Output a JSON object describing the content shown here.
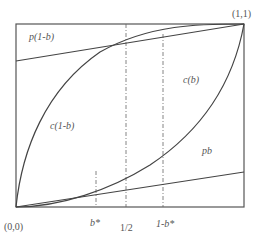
{
  "diagram": {
    "corners": {
      "origin": "(0,0)",
      "top_right": "(1,1)"
    },
    "curve_labels": {
      "p_one_minus_b": "p(1-b)",
      "c_b": "c(b)",
      "c_one_minus_b": "c(1-b)",
      "pb": "pb"
    },
    "x_ticks": {
      "b_star": "b*",
      "half": "1/2",
      "one_minus_b_star": "1-b*"
    },
    "colors": {
      "stroke": "#444444",
      "text": "#555555",
      "background": "#ffffff"
    }
  }
}
